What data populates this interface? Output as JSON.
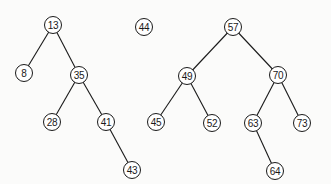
{
  "diagram": {
    "type": "binary-search-tree-forest",
    "trees": [
      {
        "root": "13",
        "nodes": [
          {
            "id": "n13",
            "label": "13",
            "x": 53,
            "y": 25
          },
          {
            "id": "n8",
            "label": "8",
            "x": 24,
            "y": 73
          },
          {
            "id": "n35",
            "label": "35",
            "x": 79,
            "y": 75
          },
          {
            "id": "n28",
            "label": "28",
            "x": 52,
            "y": 122
          },
          {
            "id": "n41",
            "label": "41",
            "x": 106,
            "y": 122
          },
          {
            "id": "n43",
            "label": "43",
            "x": 132,
            "y": 170
          }
        ],
        "edges": [
          [
            "n13",
            "n8"
          ],
          [
            "n13",
            "n35"
          ],
          [
            "n35",
            "n28"
          ],
          [
            "n35",
            "n41"
          ],
          [
            "n41",
            "n43"
          ]
        ]
      },
      {
        "root": "44",
        "nodes": [
          {
            "id": "n44",
            "label": "44",
            "x": 144,
            "y": 27
          }
        ],
        "edges": []
      },
      {
        "root": "57",
        "nodes": [
          {
            "id": "n57",
            "label": "57",
            "x": 233,
            "y": 27
          },
          {
            "id": "n49",
            "label": "49",
            "x": 187,
            "y": 76
          },
          {
            "id": "n70",
            "label": "70",
            "x": 278,
            "y": 75
          },
          {
            "id": "n45",
            "label": "45",
            "x": 156,
            "y": 122
          },
          {
            "id": "n52",
            "label": "52",
            "x": 212,
            "y": 123
          },
          {
            "id": "n63",
            "label": "63",
            "x": 253,
            "y": 123
          },
          {
            "id": "n73",
            "label": "73",
            "x": 302,
            "y": 123
          },
          {
            "id": "n64",
            "label": "64",
            "x": 275,
            "y": 171
          }
        ],
        "edges": [
          [
            "n57",
            "n49"
          ],
          [
            "n57",
            "n70"
          ],
          [
            "n49",
            "n45"
          ],
          [
            "n49",
            "n52"
          ],
          [
            "n70",
            "n63"
          ],
          [
            "n70",
            "n73"
          ],
          [
            "n63",
            "n64"
          ]
        ]
      }
    ],
    "style": {
      "stroke": "#1a1a1a",
      "node_fill": "#ffffff",
      "background": "#fbfbfa"
    }
  }
}
